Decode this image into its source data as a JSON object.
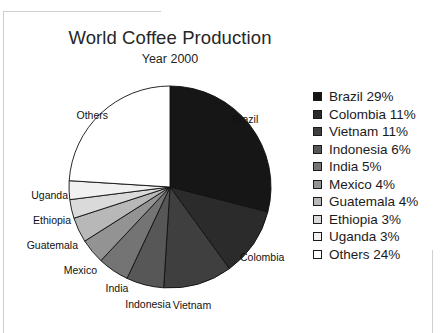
{
  "chart_data": {
    "type": "pie",
    "title": "World Coffee Production",
    "subtitle": "Year 2000",
    "unit": "%",
    "start_angle_deg": 0,
    "direction": "clockwise",
    "legend_position": "right",
    "grid": false,
    "categories": [
      "Brazil",
      "Colombia",
      "Vietnam",
      "Indonesia",
      "India",
      "Mexico",
      "Guatemala",
      "Ethiopia",
      "Uganda",
      "Others"
    ],
    "values": [
      29,
      11,
      11,
      6,
      5,
      4,
      4,
      3,
      3,
      24
    ],
    "colors": [
      "#161616",
      "#2b2b2b",
      "#3f3f3f",
      "#575757",
      "#747474",
      "#939393",
      "#b8b8b8",
      "#dadada",
      "#f1f1f1",
      "#ffffff"
    ],
    "slices": [
      {
        "label": "Brazil",
        "value": 29,
        "value_label": "Brazil 29%",
        "color": "#161616"
      },
      {
        "label": "Colombia",
        "value": 11,
        "value_label": "Colombia 11%",
        "color": "#2b2b2b"
      },
      {
        "label": "Vietnam",
        "value": 11,
        "value_label": "Vietnam 11%",
        "color": "#3f3f3f"
      },
      {
        "label": "Indonesia",
        "value": 6,
        "value_label": "Indonesia 6%",
        "color": "#575757"
      },
      {
        "label": "India",
        "value": 5,
        "value_label": "India 5%",
        "color": "#747474"
      },
      {
        "label": "Mexico",
        "value": 4,
        "value_label": "Mexico 4%",
        "color": "#939393"
      },
      {
        "label": "Guatemala",
        "value": 4,
        "value_label": "Guatemala 4%",
        "color": "#b8b8b8"
      },
      {
        "label": "Ethiopia",
        "value": 3,
        "value_label": "Ethiopia 3%",
        "color": "#dadada"
      },
      {
        "label": "Uganda",
        "value": 3,
        "value_label": "Uganda 3%",
        "color": "#f1f1f1"
      },
      {
        "label": "Others",
        "value": 24,
        "value_label": "Others 24%",
        "color": "#ffffff"
      }
    ]
  },
  "header": {
    "title": "World Coffee Production",
    "subtitle": "Year 2000"
  },
  "pie": {
    "callouts": [
      {
        "label": "Brazil",
        "x": 232,
        "y": 114,
        "align": "start"
      },
      {
        "label": "Colombia",
        "x": 240,
        "y": 252,
        "align": "start"
      },
      {
        "label": "Vietnam",
        "x": 192,
        "y": 300,
        "align": "mid"
      },
      {
        "label": "Indonesia",
        "x": 148,
        "y": 299,
        "align": "mid"
      },
      {
        "label": "India",
        "x": 117,
        "y": 283,
        "align": "mid"
      },
      {
        "label": "Mexico",
        "x": 97,
        "y": 265,
        "align": "end"
      },
      {
        "label": "Guatemala",
        "x": 78,
        "y": 240,
        "align": "end"
      },
      {
        "label": "Ethiopia",
        "x": 71,
        "y": 215,
        "align": "end"
      },
      {
        "label": "Uganda",
        "x": 68,
        "y": 190,
        "align": "end"
      },
      {
        "label": "Others",
        "x": 108,
        "y": 110,
        "align": "end"
      }
    ]
  },
  "legend": {
    "items": [
      {
        "label": "Brazil 29%",
        "color": "#161616"
      },
      {
        "label": "Colombia 11%",
        "color": "#2b2b2b"
      },
      {
        "label": "Vietnam 11%",
        "color": "#3f3f3f"
      },
      {
        "label": "Indonesia 6%",
        "color": "#575757"
      },
      {
        "label": "India 5%",
        "color": "#747474"
      },
      {
        "label": "Mexico 4%",
        "color": "#939393"
      },
      {
        "label": "Guatemala 4%",
        "color": "#b8b8b8"
      },
      {
        "label": "Ethiopia 3%",
        "color": "#dadada"
      },
      {
        "label": "Uganda 3%",
        "color": "#f1f1f1"
      },
      {
        "label": "Others 24%",
        "color": "#ffffff"
      }
    ]
  }
}
